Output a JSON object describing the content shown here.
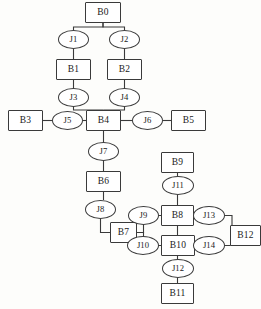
{
  "diagram": {
    "type": "block-junction-graph",
    "canvas": {
      "width": 261,
      "height": 309
    },
    "style": {
      "background": "#fdfdfb",
      "stroke": "#3a3a3a",
      "fill": "#ffffff",
      "text": "#1a1a1a"
    },
    "nodes": [
      {
        "id": "B0",
        "label": "B0",
        "shape": "box",
        "x": 85,
        "y": 2,
        "w": 36,
        "h": 21
      },
      {
        "id": "J1",
        "label": "J1",
        "shape": "ellipse",
        "x": 58,
        "y": 30,
        "w": 31,
        "h": 19
      },
      {
        "id": "J2",
        "label": "J2",
        "shape": "ellipse",
        "x": 109,
        "y": 30,
        "w": 31,
        "h": 19
      },
      {
        "id": "B1",
        "label": "B1",
        "shape": "box",
        "x": 56,
        "y": 59,
        "w": 35,
        "h": 21
      },
      {
        "id": "B2",
        "label": "B2",
        "shape": "box",
        "x": 107,
        "y": 59,
        "w": 35,
        "h": 21
      },
      {
        "id": "J3",
        "label": "J3",
        "shape": "ellipse",
        "x": 58,
        "y": 88,
        "w": 31,
        "h": 19
      },
      {
        "id": "J4",
        "label": "J4",
        "shape": "ellipse",
        "x": 109,
        "y": 88,
        "w": 31,
        "h": 19
      },
      {
        "id": "B3",
        "label": "B3",
        "shape": "box",
        "x": 8,
        "y": 110,
        "w": 35,
        "h": 21
      },
      {
        "id": "J5",
        "label": "J5",
        "shape": "ellipse",
        "x": 52,
        "y": 111,
        "w": 31,
        "h": 19
      },
      {
        "id": "B4",
        "label": "B4",
        "shape": "box",
        "x": 86,
        "y": 110,
        "w": 35,
        "h": 21
      },
      {
        "id": "J6",
        "label": "J6",
        "shape": "ellipse",
        "x": 132,
        "y": 111,
        "w": 31,
        "h": 19
      },
      {
        "id": "B5",
        "label": "B5",
        "shape": "box",
        "x": 171,
        "y": 110,
        "w": 35,
        "h": 21
      },
      {
        "id": "J7",
        "label": "J7",
        "shape": "ellipse",
        "x": 88,
        "y": 142,
        "w": 31,
        "h": 19
      },
      {
        "id": "B6",
        "label": "B6",
        "shape": "box",
        "x": 86,
        "y": 171,
        "w": 35,
        "h": 21
      },
      {
        "id": "J8",
        "label": "J8",
        "shape": "ellipse",
        "x": 85,
        "y": 200,
        "w": 31,
        "h": 19
      },
      {
        "id": "B7",
        "label": "B7",
        "shape": "box",
        "x": 110,
        "y": 222,
        "w": 27,
        "h": 21
      },
      {
        "id": "B9",
        "label": "B9",
        "shape": "box",
        "x": 161,
        "y": 152,
        "w": 33,
        "h": 21
      },
      {
        "id": "J11",
        "label": "J11",
        "shape": "ellipse",
        "x": 162,
        "y": 176,
        "w": 32,
        "h": 19
      },
      {
        "id": "J9",
        "label": "J9",
        "shape": "ellipse",
        "x": 128,
        "y": 206,
        "w": 31,
        "h": 19
      },
      {
        "id": "B8",
        "label": "B8",
        "shape": "box",
        "x": 161,
        "y": 205,
        "w": 33,
        "h": 21
      },
      {
        "id": "J13",
        "label": "J13",
        "shape": "ellipse",
        "x": 193,
        "y": 206,
        "w": 32,
        "h": 19
      },
      {
        "id": "B12",
        "label": "B12",
        "shape": "box",
        "x": 230,
        "y": 225,
        "w": 31,
        "h": 21
      },
      {
        "id": "J10",
        "label": "J10",
        "shape": "ellipse",
        "x": 127,
        "y": 236,
        "w": 32,
        "h": 19
      },
      {
        "id": "B10",
        "label": "B10",
        "shape": "box",
        "x": 161,
        "y": 235,
        "w": 34,
        "h": 21
      },
      {
        "id": "J14",
        "label": "J14",
        "shape": "ellipse",
        "x": 193,
        "y": 236,
        "w": 32,
        "h": 19
      },
      {
        "id": "J12",
        "label": "J12",
        "shape": "ellipse",
        "x": 162,
        "y": 259,
        "w": 32,
        "h": 19
      },
      {
        "id": "B11",
        "label": "B11",
        "shape": "box",
        "x": 161,
        "y": 283,
        "w": 33,
        "h": 21
      }
    ],
    "edges": [
      {
        "from": "B0",
        "to": "J1",
        "path": "M 103 23 L 103 27 L 73.5 27 L 73.5 30"
      },
      {
        "from": "B0",
        "to": "J2",
        "path": "M 103 23 L 103 27 L 124.5 27 L 124.5 30"
      },
      {
        "from": "J1",
        "to": "B1",
        "path": "M 73.5 49 L 73.5 59"
      },
      {
        "from": "J2",
        "to": "B2",
        "path": "M 124.5 49 L 124.5 59"
      },
      {
        "from": "B1",
        "to": "J3",
        "path": "M 73.5 80 L 73.5 88"
      },
      {
        "from": "B2",
        "to": "J4",
        "path": "M 124.5 80 L 124.5 88"
      },
      {
        "from": "J3",
        "to": "B4",
        "path": "M 73.5 107 L 73.5 110 L 103.5 110"
      },
      {
        "from": "J4",
        "to": "B4",
        "path": "M 124.5 107 L 124.5 110 L 103.5 110"
      },
      {
        "from": "B3",
        "to": "J5",
        "path": "M 43 120.5 L 52 120.5"
      },
      {
        "from": "J5",
        "to": "B4",
        "path": "M 83 120.5 L 86 120.5"
      },
      {
        "from": "B4",
        "to": "J6",
        "path": "M 121 120.5 L 132 120.5"
      },
      {
        "from": "J6",
        "to": "B5",
        "path": "M 163 120.5 L 171 120.5"
      },
      {
        "from": "B4",
        "to": "J7",
        "path": "M 103.5 131 L 103.5 142"
      },
      {
        "from": "J7",
        "to": "B6",
        "path": "M 103.5 161 L 103.5 171"
      },
      {
        "from": "B6",
        "to": "J8",
        "path": "M 103.5 192 L 103.5 200"
      },
      {
        "from": "J8",
        "to": "B7",
        "path": "M 100.5 219 L 100.5 232.5 L 110 232.5"
      },
      {
        "from": "B7",
        "to": "J9",
        "path": "M 137 232.5 L 143.5 232.5 L 143.5 215.5 L 128 215.5"
      },
      {
        "from": "B7",
        "to": "J10",
        "path": "M 137 232.5 L 143.5 232.5 L 143.5 245.5 L 127 245.5"
      },
      {
        "from": "J9",
        "to": "B8",
        "path": "M 159 215.5 L 161 215.5"
      },
      {
        "from": "B9",
        "to": "J11",
        "path": "M 177.5 173 L 177.5 176"
      },
      {
        "from": "J11",
        "to": "B8",
        "path": "M 177.5 195 L 177.5 205"
      },
      {
        "from": "B8",
        "to": "J13",
        "path": "M 194 215.5 L 193 215.5"
      },
      {
        "from": "J13",
        "to": "B12",
        "path": "M 225 215.5 L 232 215.5 L 232 235.5 L 230 235.5"
      },
      {
        "from": "J14",
        "to": "B12",
        "path": "M 225 245.5 L 232 245.5 L 232 235.5 L 230 235.5"
      },
      {
        "from": "J10",
        "to": "B10",
        "path": "M 159 245.5 L 161 245.5"
      },
      {
        "from": "B10",
        "to": "J14",
        "path": "M 195 245.5 L 193 245.5"
      },
      {
        "from": "B8",
        "to": "B10",
        "path": "M 177.5 226 L 177.5 235"
      },
      {
        "from": "B10",
        "to": "J12",
        "path": "M 177.5 256 L 177.5 259"
      },
      {
        "from": "J12",
        "to": "B11",
        "path": "M 177.5 278 L 177.5 283"
      }
    ]
  }
}
